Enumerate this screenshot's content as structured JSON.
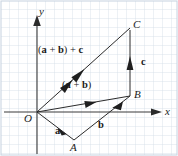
{
  "figure": {
    "background_color": "#ffffff",
    "grid_color": "#cfd9e4",
    "ink_color": "#2b2b2b",
    "width": 178,
    "height": 156,
    "grid_spacing_px": 9
  },
  "axes": {
    "x_label": "x",
    "y_label": "y",
    "origin_label": "O",
    "x_axis_y_px": 112,
    "y_axis_x_px": 37,
    "x_arrow_tip_px": 160,
    "y_arrow_tip_px": 17
  },
  "points": [
    {
      "name": "O",
      "label": "O",
      "x": 37,
      "y": 112
    },
    {
      "name": "A",
      "label": "A",
      "x": 74,
      "y": 140
    },
    {
      "name": "B",
      "label": "B",
      "x": 130,
      "y": 96
    },
    {
      "name": "C",
      "label": "C",
      "x": 130,
      "y": 28
    }
  ],
  "vectors": [
    {
      "name": "a",
      "label": "a",
      "from": "O",
      "to": "A",
      "style": "bold"
    },
    {
      "name": "b",
      "label": "b",
      "from": "A",
      "to": "B",
      "style": "bold"
    },
    {
      "name": "a_plus_b",
      "label": "(a + b)",
      "from": "O",
      "to": "B",
      "style": "bold-parenthesized"
    },
    {
      "name": "c",
      "label": "c",
      "from": "B",
      "to": "C",
      "style": "bold"
    },
    {
      "name": "sum",
      "label": "(a + b) + c",
      "from": "O",
      "to": "C",
      "style": "bold-parenthesized"
    }
  ],
  "labels": {
    "a": "a",
    "b": "b",
    "c": "c",
    "a_plus_b_open": "(",
    "a_plus_b_a": "a",
    "a_plus_b_plus": " + ",
    "a_plus_b_b": "b",
    "a_plus_b_close": ")",
    "sum_tail": " + ",
    "sum_c": "c"
  }
}
